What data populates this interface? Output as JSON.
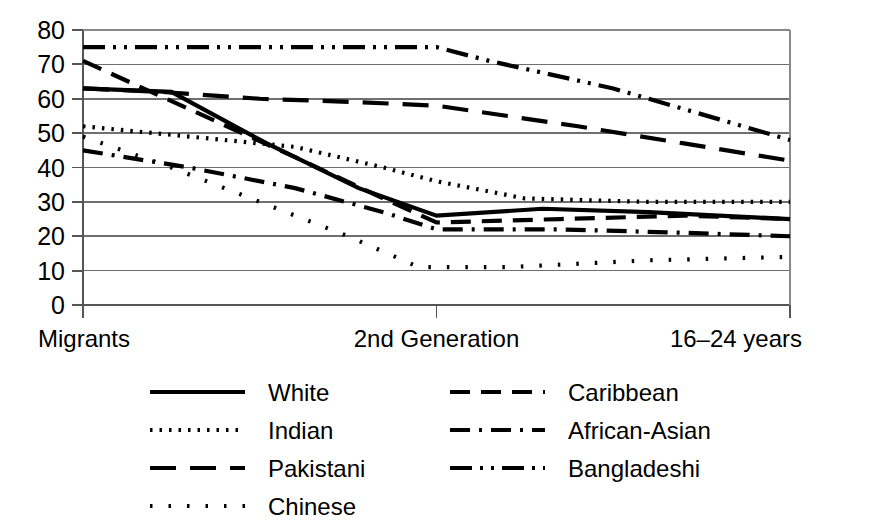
{
  "chart_data": {
    "type": "line",
    "title": "",
    "subtitle": "",
    "xlabel": "",
    "ylabel": "",
    "ylim": [
      0,
      80
    ],
    "y_ticks": [
      0,
      10,
      20,
      30,
      40,
      50,
      60,
      70,
      80
    ],
    "y_tick_labels": [
      "0",
      "10",
      "20",
      "30",
      "40",
      "50",
      "60",
      "70",
      "80"
    ],
    "grid": "horizontal",
    "legend_position": "bottom",
    "categories": [
      "Migrants",
      "2nd Generation",
      "16–24 years"
    ],
    "x_positions": [
      0,
      1,
      2
    ],
    "series": [
      {
        "name": "White",
        "dash": "solid",
        "color": "#000000",
        "values": [
          63,
          26,
          25
        ],
        "points": [
          [
            0.0,
            63
          ],
          [
            0.25,
            62
          ],
          [
            0.52,
            47
          ],
          [
            0.78,
            34
          ],
          [
            1.0,
            26
          ],
          [
            1.3,
            28
          ],
          [
            1.6,
            27
          ],
          [
            2.0,
            25
          ]
        ]
      },
      {
        "name": "Indian",
        "dash": "dotted",
        "color": "#000000",
        "values": [
          52,
          36,
          30
        ],
        "points": [
          [
            0.0,
            52
          ],
          [
            0.3,
            49
          ],
          [
            0.6,
            46
          ],
          [
            0.85,
            40
          ],
          [
            1.0,
            36
          ],
          [
            1.25,
            31
          ],
          [
            1.6,
            30
          ],
          [
            2.0,
            30
          ]
        ]
      },
      {
        "name": "Pakistani",
        "dash": "dashed-long",
        "color": "#000000",
        "values": [
          63,
          58,
          42
        ],
        "points": [
          [
            0.0,
            63
          ],
          [
            0.22,
            62
          ],
          [
            0.5,
            60
          ],
          [
            0.78,
            59
          ],
          [
            1.0,
            58
          ],
          [
            1.4,
            52
          ],
          [
            1.7,
            47
          ],
          [
            2.0,
            42
          ]
        ]
      },
      {
        "name": "Chinese",
        "dash": "dotted-sparse",
        "color": "#000000",
        "values": [
          49,
          11,
          14
        ],
        "points": [
          [
            0.0,
            49
          ],
          [
            0.25,
            40
          ],
          [
            0.5,
            30
          ],
          [
            0.75,
            20
          ],
          [
            0.95,
            11
          ],
          [
            1.2,
            11
          ],
          [
            1.6,
            13
          ],
          [
            2.0,
            14
          ]
        ]
      },
      {
        "name": "Caribbean",
        "dash": "dashed-medium",
        "color": "#000000",
        "values": [
          71,
          24,
          25
        ],
        "points": [
          [
            0.0,
            71
          ],
          [
            0.3,
            57
          ],
          [
            0.6,
            43
          ],
          [
            0.85,
            31
          ],
          [
            1.0,
            24
          ],
          [
            1.35,
            25
          ],
          [
            1.7,
            26
          ],
          [
            2.0,
            25
          ]
        ]
      },
      {
        "name": "African-Asian",
        "dash": "dash-dot",
        "color": "#000000",
        "values": [
          45,
          22,
          20
        ],
        "points": [
          [
            0.0,
            45
          ],
          [
            0.3,
            40
          ],
          [
            0.6,
            34
          ],
          [
            0.85,
            27
          ],
          [
            1.0,
            22
          ],
          [
            1.35,
            22
          ],
          [
            1.7,
            21
          ],
          [
            2.0,
            20
          ]
        ]
      },
      {
        "name": "Bangladeshi",
        "dash": "dash-dot-dot",
        "color": "#000000",
        "values": [
          75,
          75,
          48
        ],
        "points": [
          [
            0.0,
            75
          ],
          [
            0.4,
            75
          ],
          [
            0.75,
            75
          ],
          [
            1.0,
            75
          ],
          [
            1.15,
            71
          ],
          [
            1.5,
            63
          ],
          [
            1.8,
            54
          ],
          [
            2.0,
            48
          ]
        ]
      }
    ]
  },
  "axis": {
    "y_tick_labels": [
      "80",
      "70",
      "60",
      "50",
      "40",
      "30",
      "20",
      "10",
      "0"
    ],
    "x_labels": [
      "Migrants",
      "2nd Generation",
      "16–24 years"
    ]
  },
  "legend": {
    "column_left": [
      {
        "label": "White",
        "dash": "solid"
      },
      {
        "label": "Indian",
        "dash": "dotted"
      },
      {
        "label": "Pakistani",
        "dash": "dashed-long"
      },
      {
        "label": "Chinese",
        "dash": "dotted-sparse"
      }
    ],
    "column_right": [
      {
        "label": "Caribbean",
        "dash": "dashed-medium"
      },
      {
        "label": "African-Asian",
        "dash": "dash-dot"
      },
      {
        "label": "Bangladeshi",
        "dash": "dash-dot-dot"
      }
    ]
  }
}
